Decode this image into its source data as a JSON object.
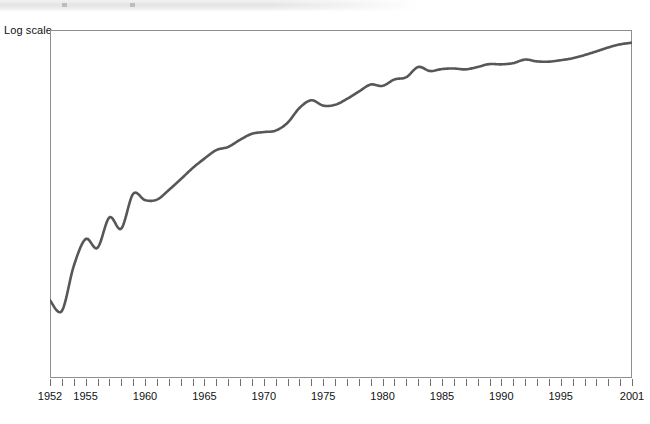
{
  "chart_data": {
    "type": "line",
    "title": "",
    "subtitle": "",
    "xlabel": "",
    "ylabel": "Log scale",
    "axis_note": "Log scale",
    "grid": false,
    "legend": "none",
    "line_color": "#575757",
    "frame_color": "#8e8e8e",
    "xlim": [
      1952,
      2001
    ],
    "ylim_note": "unlabeled logarithmic vertical axis",
    "tick_labels": [
      "1952",
      "1955",
      "1960",
      "1965",
      "1970",
      "1975",
      "1980",
      "1985",
      "1990",
      "1995",
      "2001"
    ],
    "tick_label_years": [
      1952,
      1955,
      1960,
      1965,
      1970,
      1975,
      1980,
      1985,
      1990,
      1995,
      2001
    ],
    "minor_tick_interval_years": 1,
    "x": [
      1952,
      1953,
      1954,
      1955,
      1956,
      1957,
      1958,
      1959,
      1960,
      1961,
      1962,
      1963,
      1964,
      1965,
      1966,
      1967,
      1968,
      1969,
      1970,
      1971,
      1972,
      1973,
      1974,
      1975,
      1976,
      1977,
      1978,
      1979,
      1980,
      1981,
      1982,
      1983,
      1984,
      1985,
      1986,
      1987,
      1988,
      1989,
      1990,
      1991,
      1992,
      1993,
      1994,
      1995,
      1996,
      1997,
      1998,
      1999,
      2000,
      2001
    ],
    "values": [
      10.0,
      9.1,
      13.6,
      17.3,
      16.0,
      21.0,
      19.0,
      25.9,
      24.5,
      24.6,
      26.8,
      29.5,
      32.6,
      35.5,
      38.3,
      39.4,
      42.0,
      44.3,
      45.0,
      45.6,
      48.9,
      55.8,
      59.8,
      57.0,
      57.4,
      60.5,
      64.6,
      68.8,
      68.0,
      72.0,
      73.5,
      80.5,
      77.6,
      79.0,
      79.4,
      78.8,
      80.5,
      82.6,
      82.4,
      83.3,
      86.0,
      84.6,
      84.4,
      85.5,
      87.0,
      89.5,
      92.5,
      95.8,
      98.5,
      100.0
    ],
    "values_note": "relative index read off the unlabeled log axis, 2001 = 100",
    "annotations": []
  },
  "top_strip": {
    "visible": true,
    "description": "partially cropped light gray toolbar strip"
  }
}
